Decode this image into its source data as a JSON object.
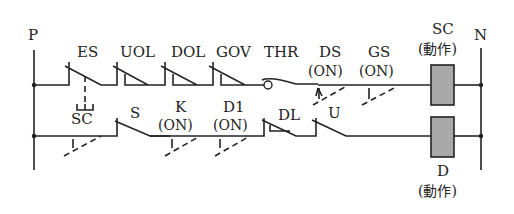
{
  "diagram": {
    "type": "ladder-circuit",
    "rails": {
      "left": "P",
      "right": "N"
    },
    "upper_rung": {
      "contacts": [
        {
          "label": "ES",
          "kind": "nc-contact-linked"
        },
        {
          "label": "UOL",
          "kind": "nc-limit-switch"
        },
        {
          "label": "DOL",
          "kind": "nc-limit-switch"
        },
        {
          "label": "GOV",
          "kind": "nc-limit-switch"
        },
        {
          "label": "THR",
          "kind": "thermal-relay-contact"
        },
        {
          "label": "DS",
          "state": "(ON)",
          "kind": "no-contact-actuated"
        },
        {
          "label": "GS",
          "state": "(ON)",
          "kind": "no-contact-actuated"
        }
      ],
      "coil": {
        "label": "SC",
        "state": "(動作)",
        "color": "#a9a9a9"
      }
    },
    "lower_rung": {
      "contacts": [
        {
          "label": "SC",
          "kind": "no-contact-actuated",
          "linked_from": "ES"
        },
        {
          "label": "S",
          "kind": "nc-contact"
        },
        {
          "label": "K",
          "state": "(ON)",
          "kind": "no-contact-actuated"
        },
        {
          "label": "D1",
          "state": "(ON)",
          "kind": "no-contact-actuated"
        },
        {
          "label": "DL",
          "kind": "nc-limit-switch"
        },
        {
          "label": "U",
          "kind": "nc-contact"
        }
      ],
      "coil": {
        "label": "D",
        "state": "(動作)",
        "color": "#a9a9a9"
      }
    }
  }
}
